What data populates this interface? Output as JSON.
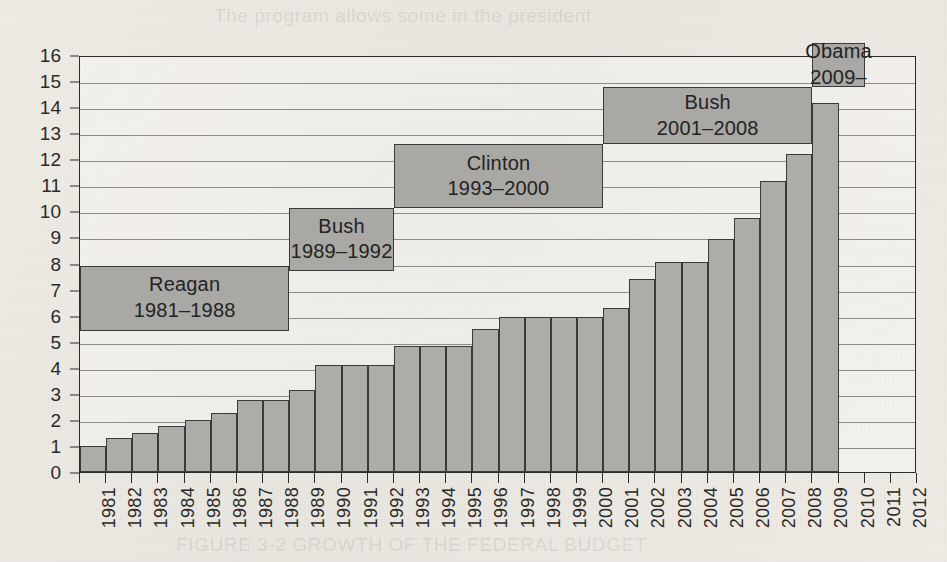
{
  "page": {
    "bleed_text_top": "The program allows some in the president",
    "bleed_text_bottom": "FIGURE 3-2 GROWTH OF THE FEDERAL BUDGET"
  },
  "colors": {
    "bar_fill": "#adaca9",
    "bar_stroke": "#3a3a3a",
    "annotation_fill": "#a9a8a5",
    "gridline": "#8d8b86",
    "axis": "#2b2b2b",
    "paper": "#ece9e2"
  },
  "chart_data": {
    "type": "bar",
    "title": "",
    "xlabel": "",
    "ylabel": "",
    "ylim": [
      0,
      16
    ],
    "ytick_labels": [
      "0",
      "1",
      "2",
      "3",
      "4",
      "5",
      "6",
      "7",
      "8",
      "9",
      "10",
      "11",
      "12",
      "13",
      "14",
      "15",
      "16"
    ],
    "ytick_values": [
      0,
      1,
      2,
      3,
      4,
      5,
      6,
      7,
      8,
      9,
      10,
      11,
      12,
      13,
      14,
      15,
      16
    ],
    "grid": true,
    "legend": "none",
    "categories": [
      "1981",
      "1982",
      "1983",
      "1984",
      "1985",
      "1986",
      "1987",
      "1988",
      "1989",
      "1990",
      "1991",
      "1992",
      "1993",
      "1994",
      "1995",
      "1996",
      "1997",
      "1998",
      "1999",
      "2000",
      "2001",
      "2002",
      "2003",
      "2004",
      "2005",
      "2006",
      "2007",
      "2008",
      "2009",
      "2010",
      "2011",
      "2012"
    ],
    "values": [
      1.0,
      1.3,
      1.5,
      1.75,
      2.0,
      2.25,
      2.75,
      2.75,
      3.15,
      4.1,
      4.1,
      4.1,
      4.85,
      4.85,
      4.85,
      5.5,
      5.95,
      5.95,
      5.95,
      5.95,
      6.3,
      7.4,
      8.05,
      8.05,
      8.95,
      9.75,
      11.15,
      12.2,
      14.15,
      null,
      null,
      null
    ],
    "annotations": [
      {
        "name": "Reagan",
        "years": "1981–1988",
        "start_year": "1981",
        "end_year": "1988",
        "y_bottom": 5.5,
        "y_top": 8.0
      },
      {
        "name": "Bush",
        "years": "1989–1992",
        "start_year": "1989",
        "end_year": "1992",
        "y_bottom": 7.8,
        "y_top": 10.2
      },
      {
        "name": "Clinton",
        "years": "1993–2000",
        "start_year": "1993",
        "end_year": "2000",
        "y_bottom": 10.2,
        "y_top": 12.65
      },
      {
        "name": "Bush",
        "years": "2001–2008",
        "start_year": "2001",
        "end_year": "2008",
        "y_bottom": 12.65,
        "y_top": 14.85
      },
      {
        "name": "Obama",
        "years": "2009–",
        "start_year": "2009",
        "end_year": "2010",
        "y_bottom": 14.85,
        "y_top": 16.55
      }
    ]
  }
}
